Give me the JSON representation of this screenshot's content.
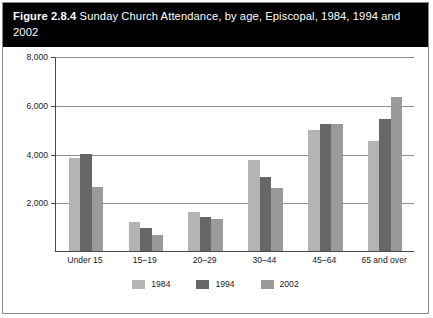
{
  "figure": {
    "number": "Figure 2.8.4",
    "caption": " Sunday Church Attendance, by age, Episcopal, 1984, 1994 and 2002"
  },
  "colors": {
    "series_1984": "#b4b4b4",
    "series_1994": "#676767",
    "series_2002": "#9a9a9a",
    "gridline": "#8e8e8e",
    "axis": "#4a4a4a",
    "title_band": "#000000",
    "title_text": "#ffffff"
  },
  "chart_data": {
    "type": "bar",
    "title": "Figure 2.8.4 Sunday Church Attendance, by age, Episcopal, 1984, 1994 and 2002",
    "xlabel": "",
    "ylabel": "",
    "categories": [
      "Under 15",
      "15–19",
      "20–29",
      "30–44",
      "45–64",
      "65 and over"
    ],
    "series": [
      {
        "name": "1984",
        "color": "#b4b4b4",
        "values": [
          3820,
          1180,
          1600,
          3750,
          4950,
          4500
        ]
      },
      {
        "name": "1994",
        "color": "#676767",
        "values": [
          4000,
          950,
          1400,
          3050,
          5200,
          5400
        ]
      },
      {
        "name": "2002",
        "color": "#9a9a9a",
        "values": [
          2620,
          650,
          1300,
          2600,
          5200,
          6300
        ]
      }
    ],
    "ylim": [
      0,
      8000
    ],
    "yticks": [
      2000,
      4000,
      6000,
      8000
    ],
    "ytick_labels": [
      "2,000",
      "4,000",
      "6,000",
      "8,000"
    ],
    "grid": true,
    "legend_position": "bottom"
  }
}
